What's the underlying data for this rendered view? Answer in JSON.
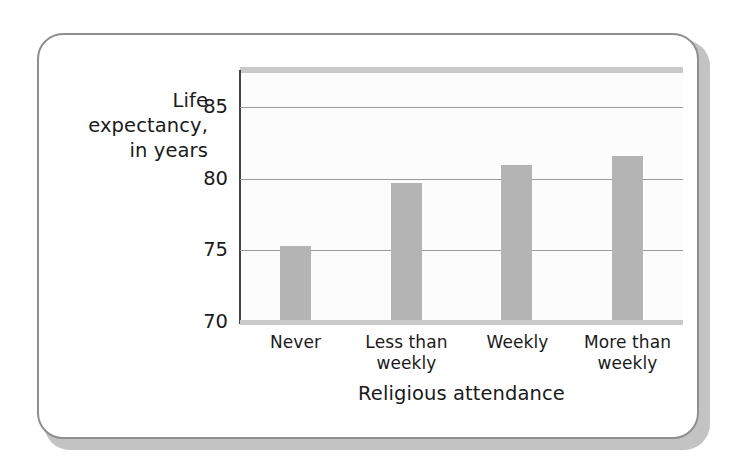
{
  "figure": {
    "frame_border_color": "#8f8f8f",
    "frame_shadow_color": "#c3c3c3",
    "canvas_color": "#ffffff"
  },
  "chart_data": {
    "type": "bar",
    "title": "",
    "categories": [
      "Never",
      "Less than\nweekly",
      "Weekly",
      "More than\nweekly"
    ],
    "values": [
      75.3,
      79.7,
      81.0,
      81.6
    ],
    "xlabel": "Religious attendance",
    "ylabel": "Life\nexpectancy,\nin years",
    "ylim": [
      70,
      87.4
    ],
    "yticks": [
      70,
      75,
      80,
      85
    ],
    "ytick_labels": [
      "70",
      "75",
      "80",
      "85"
    ],
    "grid": true,
    "gridline_color": "#9a9a9a",
    "bar_color": "#b4b4b4",
    "axis_color": "#444444",
    "legend": null,
    "legend_position": "none",
    "plot_background": "#fcfcfc"
  }
}
